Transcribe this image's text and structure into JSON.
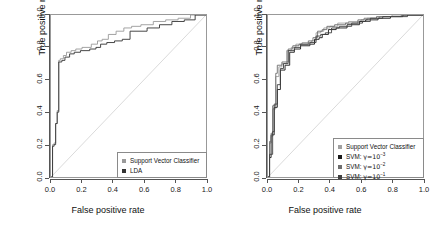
{
  "figure": {
    "background": "#ffffff",
    "panel_count": 2
  },
  "chart_data": [
    {
      "type": "line",
      "panel": "left",
      "title": "",
      "xlabel": "False positive rate",
      "ylabel": "True positive rate",
      "xlim": [
        0.0,
        1.0
      ],
      "ylim": [
        0.0,
        1.0
      ],
      "xticks": [
        "0.0",
        "0.2",
        "0.4",
        "0.6",
        "0.8",
        "1.0"
      ],
      "yticks": [
        "0.0",
        "0.2",
        "0.4",
        "0.6",
        "0.8",
        "1.0"
      ],
      "grid": false,
      "legend_position": "bottom-right",
      "reference_line": {
        "name": "chance-diagonal",
        "from": [
          0.0,
          0.0
        ],
        "to": [
          1.0,
          1.0
        ],
        "color": "#d9d9d9"
      },
      "series": [
        {
          "name": "Support Vector Classifier",
          "color": "#9a9a9a",
          "marker": "square",
          "x": [
            0.0,
            0.01,
            0.01,
            0.02,
            0.02,
            0.03,
            0.03,
            0.04,
            0.04,
            0.05,
            0.05,
            0.06,
            0.06,
            0.08,
            0.08,
            0.1,
            0.1,
            0.13,
            0.13,
            0.16,
            0.16,
            0.2,
            0.2,
            0.26,
            0.26,
            0.3,
            0.3,
            0.33,
            0.33,
            0.37,
            0.37,
            0.42,
            0.42,
            0.47,
            0.47,
            0.52,
            0.52,
            0.58,
            0.58,
            0.66,
            0.66,
            0.74,
            0.74,
            0.82,
            0.82,
            0.9,
            0.9,
            1.0
          ],
          "y": [
            0.0,
            0.0,
            0.2,
            0.2,
            0.21,
            0.21,
            0.33,
            0.33,
            0.41,
            0.41,
            0.72,
            0.72,
            0.73,
            0.73,
            0.75,
            0.75,
            0.77,
            0.77,
            0.78,
            0.78,
            0.79,
            0.79,
            0.8,
            0.8,
            0.82,
            0.82,
            0.84,
            0.84,
            0.85,
            0.85,
            0.88,
            0.88,
            0.9,
            0.9,
            0.92,
            0.92,
            0.93,
            0.93,
            0.94,
            0.94,
            0.96,
            0.96,
            0.97,
            0.97,
            0.98,
            0.98,
            1.0,
            1.0
          ]
        },
        {
          "name": "LDA",
          "color": "#333333",
          "marker": "square",
          "x": [
            0.0,
            0.01,
            0.01,
            0.02,
            0.02,
            0.03,
            0.03,
            0.04,
            0.04,
            0.05,
            0.05,
            0.07,
            0.07,
            0.09,
            0.09,
            0.12,
            0.12,
            0.15,
            0.15,
            0.19,
            0.19,
            0.25,
            0.25,
            0.29,
            0.29,
            0.32,
            0.32,
            0.36,
            0.36,
            0.41,
            0.41,
            0.46,
            0.46,
            0.51,
            0.51,
            0.62,
            0.62,
            0.7,
            0.7,
            0.78,
            0.78,
            0.86,
            0.86,
            0.93,
            0.93,
            1.0
          ],
          "y": [
            0.0,
            0.0,
            0.19,
            0.19,
            0.2,
            0.2,
            0.33,
            0.33,
            0.4,
            0.4,
            0.71,
            0.71,
            0.72,
            0.72,
            0.74,
            0.74,
            0.76,
            0.76,
            0.77,
            0.77,
            0.78,
            0.78,
            0.79,
            0.79,
            0.8,
            0.8,
            0.82,
            0.82,
            0.83,
            0.83,
            0.84,
            0.84,
            0.85,
            0.85,
            0.9,
            0.9,
            0.92,
            0.92,
            0.94,
            0.94,
            0.96,
            0.96,
            0.97,
            0.97,
            1.0,
            1.0
          ]
        }
      ],
      "legend": [
        {
          "label": "Support Vector Classifier",
          "color": "#9a9a9a"
        },
        {
          "label": "LDA",
          "color": "#333333"
        }
      ]
    },
    {
      "type": "line",
      "panel": "right",
      "title": "",
      "xlabel": "False positive rate",
      "ylabel": "True positive rate",
      "xlim": [
        0.0,
        1.0
      ],
      "ylim": [
        0.0,
        1.0
      ],
      "xticks": [
        "0.0",
        "0.2",
        "0.4",
        "0.6",
        "0.8",
        "1.0"
      ],
      "yticks": [
        "0.0",
        "0.2",
        "0.4",
        "0.6",
        "0.8",
        "1.0"
      ],
      "grid": false,
      "legend_position": "bottom-right",
      "reference_line": {
        "name": "chance-diagonal",
        "from": [
          0.0,
          0.0
        ],
        "to": [
          1.0,
          1.0
        ],
        "color": "#d9d9d9"
      },
      "series": [
        {
          "name": "Support Vector Classifier",
          "color": "#a0a0a0",
          "marker": "square",
          "x": [
            0.0,
            0.01,
            0.01,
            0.02,
            0.02,
            0.03,
            0.03,
            0.05,
            0.05,
            0.07,
            0.07,
            0.09,
            0.09,
            0.12,
            0.12,
            0.15,
            0.15,
            0.18,
            0.18,
            0.22,
            0.22,
            0.28,
            0.28,
            0.31,
            0.31,
            0.34,
            0.34,
            0.36,
            0.36,
            0.4,
            0.4,
            0.45,
            0.45,
            0.52,
            0.52,
            0.6,
            0.6,
            0.64,
            0.64,
            0.72,
            0.72,
            0.8,
            0.8,
            0.88,
            0.88,
            1.0
          ],
          "y": [
            0.0,
            0.0,
            0.21,
            0.21,
            0.25,
            0.25,
            0.42,
            0.42,
            0.62,
            0.62,
            0.68,
            0.68,
            0.7,
            0.7,
            0.78,
            0.78,
            0.8,
            0.8,
            0.82,
            0.82,
            0.83,
            0.83,
            0.84,
            0.84,
            0.89,
            0.89,
            0.9,
            0.9,
            0.92,
            0.92,
            0.93,
            0.93,
            0.95,
            0.95,
            0.96,
            0.96,
            0.97,
            0.97,
            0.98,
            0.98,
            0.99,
            0.99,
            1.0,
            1.0,
            1.0,
            1.0
          ]
        },
        {
          "name": "SVM: gamma=1e-3",
          "color": "#1a1a1a",
          "marker": "square",
          "x": [
            0.0,
            0.01,
            0.01,
            0.02,
            0.02,
            0.04,
            0.04,
            0.06,
            0.06,
            0.08,
            0.08,
            0.11,
            0.11,
            0.14,
            0.14,
            0.17,
            0.17,
            0.21,
            0.21,
            0.27,
            0.27,
            0.3,
            0.3,
            0.33,
            0.33,
            0.35,
            0.35,
            0.39,
            0.39,
            0.44,
            0.44,
            0.51,
            0.51,
            0.59,
            0.59,
            0.63,
            0.63,
            0.71,
            0.71,
            0.79,
            0.79,
            0.87,
            0.87,
            1.0
          ],
          "y": [
            0.0,
            0.0,
            0.12,
            0.12,
            0.26,
            0.26,
            0.43,
            0.43,
            0.54,
            0.54,
            0.66,
            0.66,
            0.69,
            0.69,
            0.77,
            0.77,
            0.79,
            0.79,
            0.81,
            0.81,
            0.82,
            0.82,
            0.85,
            0.85,
            0.86,
            0.86,
            0.88,
            0.88,
            0.91,
            0.91,
            0.92,
            0.92,
            0.94,
            0.94,
            0.96,
            0.96,
            0.97,
            0.97,
            0.98,
            0.98,
            0.99,
            0.99,
            1.0,
            1.0
          ]
        },
        {
          "name": "SVM: gamma=1e-2",
          "color": "#6e6e6e",
          "marker": "square",
          "x": [
            0.0,
            0.01,
            0.01,
            0.02,
            0.02,
            0.03,
            0.03,
            0.05,
            0.05,
            0.06,
            0.06,
            0.09,
            0.09,
            0.13,
            0.13,
            0.16,
            0.16,
            0.2,
            0.2,
            0.26,
            0.26,
            0.29,
            0.29,
            0.32,
            0.32,
            0.35,
            0.35,
            0.38,
            0.38,
            0.43,
            0.43,
            0.5,
            0.5,
            0.58,
            0.58,
            0.62,
            0.62,
            0.7,
            0.7,
            0.78,
            0.78,
            0.86,
            0.86,
            1.0
          ],
          "y": [
            0.0,
            0.0,
            0.22,
            0.22,
            0.27,
            0.27,
            0.44,
            0.44,
            0.64,
            0.64,
            0.69,
            0.69,
            0.71,
            0.71,
            0.79,
            0.79,
            0.81,
            0.81,
            0.82,
            0.82,
            0.84,
            0.84,
            0.86,
            0.86,
            0.9,
            0.9,
            0.91,
            0.91,
            0.93,
            0.93,
            0.94,
            0.94,
            0.95,
            0.95,
            0.97,
            0.97,
            0.98,
            0.98,
            0.99,
            0.99,
            0.99,
            0.99,
            1.0,
            1.0
          ]
        },
        {
          "name": "SVM: gamma=1e-1",
          "color": "#404040",
          "marker": "square",
          "x": [
            0.0,
            0.01,
            0.01,
            0.03,
            0.03,
            0.04,
            0.04,
            0.06,
            0.06,
            0.08,
            0.08,
            0.1,
            0.1,
            0.13,
            0.13,
            0.17,
            0.17,
            0.21,
            0.21,
            0.27,
            0.27,
            0.31,
            0.31,
            0.34,
            0.34,
            0.37,
            0.37,
            0.41,
            0.41,
            0.46,
            0.46,
            0.54,
            0.54,
            0.61,
            0.61,
            0.66,
            0.66,
            0.74,
            0.74,
            0.82,
            0.82,
            0.9,
            0.9,
            1.0
          ],
          "y": [
            0.0,
            0.0,
            0.14,
            0.14,
            0.28,
            0.28,
            0.45,
            0.45,
            0.57,
            0.57,
            0.67,
            0.67,
            0.7,
            0.7,
            0.78,
            0.78,
            0.8,
            0.8,
            0.82,
            0.82,
            0.83,
            0.83,
            0.87,
            0.87,
            0.88,
            0.88,
            0.89,
            0.89,
            0.92,
            0.92,
            0.93,
            0.93,
            0.95,
            0.95,
            0.96,
            0.96,
            0.98,
            0.98,
            0.99,
            0.99,
            0.99,
            0.99,
            1.0,
            1.0
          ]
        }
      ],
      "legend": [
        {
          "label": "Support Vector Classifier",
          "color": "#a0a0a0",
          "base": "",
          "exp": ""
        },
        {
          "label": "SVM:",
          "color": "#1a1a1a",
          "base": "γ=10",
          "exp": "−3"
        },
        {
          "label": "SVM:",
          "color": "#6e6e6e",
          "base": "γ=10",
          "exp": "−2"
        },
        {
          "label": "SVM:",
          "color": "#404040",
          "base": "γ=10",
          "exp": "−1"
        }
      ]
    }
  ],
  "axes": {
    "xlabel": "False positive rate",
    "ylabel": "True positive rate",
    "xticks": [
      "0.0",
      "0.2",
      "0.4",
      "0.6",
      "0.8",
      "1.0"
    ],
    "yticks": [
      "0.0",
      "0.2",
      "0.4",
      "0.6",
      "0.8",
      "1.0"
    ]
  },
  "left_legend": {
    "items": [
      {
        "label": "Support Vector Classifier"
      },
      {
        "label": "LDA"
      }
    ]
  },
  "right_legend": {
    "items": [
      {
        "label": "Support Vector Classifier",
        "base": "",
        "exp": ""
      },
      {
        "label": "SVM:",
        "base": "γ=10",
        "exp": "−3"
      },
      {
        "label": "SVM:",
        "base": "γ=10",
        "exp": "−2"
      },
      {
        "label": "SVM:",
        "base": "γ=10",
        "exp": "−1"
      }
    ]
  },
  "colors": {
    "svc": "#9a9a9a",
    "lda": "#333333",
    "gamma_1e3": "#1a1a1a",
    "gamma_1e2": "#6e6e6e",
    "gamma_1e1": "#404040",
    "diagonal": "#d9d9d9",
    "box": "#999999"
  }
}
